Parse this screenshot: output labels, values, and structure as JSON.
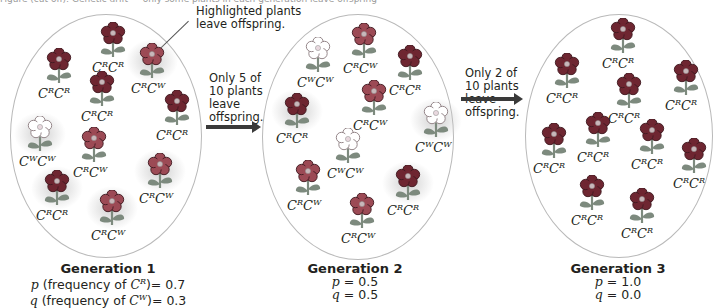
{
  "caption_top": "Figure (cut off): Genetic drift — only some plants in each generation leave offspring",
  "callout": {
    "text_line1": "Highlighted plants",
    "text_line2": "leave offspring."
  },
  "transitions": [
    {
      "line1": "Only 5 of",
      "line2": "10 plants",
      "line3": "leave",
      "line4": "offspring."
    },
    {
      "line1": "Only 2 of",
      "line2": "10 plants",
      "line3": "leave",
      "line4": "offspring."
    }
  ],
  "colors": {
    "CRCR": "#6e2631",
    "CRCW": "#9c4a55",
    "CWCW": "#ffffff",
    "leaf": "#7d8a7e",
    "ellipse_border": "#b9b9b9",
    "arrow": "#3a3a3a"
  },
  "generations": [
    {
      "title": "Generation 1",
      "p_line": {
        "var": "p",
        "text": " (frequency of ",
        "allele": "C",
        "sup": "R",
        "tail": ")= 0.7"
      },
      "q_line": {
        "var": "q",
        "text": " (frequency of ",
        "allele": "C",
        "sup": "W",
        "tail": ")= 0.3"
      },
      "p": 0.7,
      "q": 0.3,
      "plants": [
        {
          "genotype": "CRCR",
          "a1": "R",
          "a2": "R",
          "x": 91,
          "y": 22,
          "highlight": false
        },
        {
          "genotype": "CRCR",
          "a1": "R",
          "a2": "R",
          "x": 37,
          "y": 48,
          "highlight": false
        },
        {
          "genotype": "CRCW",
          "a1": "R",
          "a2": "W",
          "x": 130,
          "y": 43,
          "highlight": true
        },
        {
          "genotype": "CRCR",
          "a1": "R",
          "a2": "R",
          "x": 80,
          "y": 71,
          "highlight": false
        },
        {
          "genotype": "CRCR",
          "a1": "R",
          "a2": "R",
          "x": 155,
          "y": 90,
          "highlight": false
        },
        {
          "genotype": "CWCW",
          "a1": "W",
          "a2": "W",
          "x": 18,
          "y": 116,
          "highlight": true
        },
        {
          "genotype": "CRCW",
          "a1": "R",
          "a2": "W",
          "x": 72,
          "y": 127,
          "highlight": false
        },
        {
          "genotype": "CRCW",
          "a1": "R",
          "a2": "W",
          "x": 138,
          "y": 153,
          "highlight": true
        },
        {
          "genotype": "CRCR",
          "a1": "R",
          "a2": "R",
          "x": 35,
          "y": 170,
          "highlight": true
        },
        {
          "genotype": "CRCW",
          "a1": "R",
          "a2": "W",
          "x": 90,
          "y": 190,
          "highlight": true
        }
      ]
    },
    {
      "title": "Generation 2",
      "p_line": {
        "var": "p",
        "text": " = 0.5"
      },
      "q_line": {
        "var": "q",
        "text": " = 0.5"
      },
      "p": 0.5,
      "q": 0.5,
      "plants": [
        {
          "genotype": "CWCW",
          "a1": "W",
          "a2": "W",
          "x": 296,
          "y": 37,
          "highlight": false
        },
        {
          "genotype": "CRCW",
          "a1": "R",
          "a2": "W",
          "x": 342,
          "y": 23,
          "highlight": false
        },
        {
          "genotype": "CRCR",
          "a1": "R",
          "a2": "R",
          "x": 388,
          "y": 45,
          "highlight": false
        },
        {
          "genotype": "CRCR",
          "a1": "R",
          "a2": "R",
          "x": 275,
          "y": 93,
          "highlight": true
        },
        {
          "genotype": "CRCW",
          "a1": "R",
          "a2": "W",
          "x": 352,
          "y": 80,
          "highlight": false
        },
        {
          "genotype": "CWCW",
          "a1": "W",
          "a2": "W",
          "x": 414,
          "y": 102,
          "highlight": true
        },
        {
          "genotype": "CWCW",
          "a1": "W",
          "a2": "W",
          "x": 326,
          "y": 128,
          "highlight": false
        },
        {
          "genotype": "CRCW",
          "a1": "R",
          "a2": "W",
          "x": 286,
          "y": 160,
          "highlight": false
        },
        {
          "genotype": "CRCR",
          "a1": "R",
          "a2": "R",
          "x": 386,
          "y": 165,
          "highlight": true
        },
        {
          "genotype": "CRCW",
          "a1": "R",
          "a2": "W",
          "x": 340,
          "y": 193,
          "highlight": false
        }
      ]
    },
    {
      "title": "Generation 3",
      "p_line": {
        "var": "p",
        "text": " = 1.0"
      },
      "q_line": {
        "var": "q",
        "text": " = 0.0"
      },
      "p": 1.0,
      "q": 0.0,
      "plants": [
        {
          "genotype": "CRCR",
          "a1": "R",
          "a2": "R",
          "x": 601,
          "y": 18,
          "highlight": false
        },
        {
          "genotype": "CRCR",
          "a1": "R",
          "a2": "R",
          "x": 545,
          "y": 53,
          "highlight": false
        },
        {
          "genotype": "CRCR",
          "a1": "R",
          "a2": "R",
          "x": 664,
          "y": 60,
          "highlight": false
        },
        {
          "genotype": "CRCR",
          "a1": "R",
          "a2": "R",
          "x": 607,
          "y": 73,
          "highlight": false
        },
        {
          "genotype": "CRCR",
          "a1": "R",
          "a2": "R",
          "x": 532,
          "y": 123,
          "highlight": false
        },
        {
          "genotype": "CRCR",
          "a1": "R",
          "a2": "R",
          "x": 576,
          "y": 112,
          "highlight": false
        },
        {
          "genotype": "CRCR",
          "a1": "R",
          "a2": "R",
          "x": 630,
          "y": 119,
          "highlight": false
        },
        {
          "genotype": "CRCR",
          "a1": "R",
          "a2": "R",
          "x": 672,
          "y": 138,
          "highlight": false
        },
        {
          "genotype": "CRCR",
          "a1": "R",
          "a2": "R",
          "x": 570,
          "y": 175,
          "highlight": false
        },
        {
          "genotype": "CRCR",
          "a1": "R",
          "a2": "R",
          "x": 620,
          "y": 188,
          "highlight": false
        }
      ]
    }
  ]
}
